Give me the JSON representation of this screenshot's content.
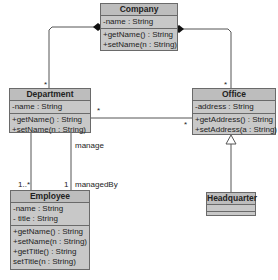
{
  "diagram": {
    "type": "uml-class-diagram",
    "classes": [
      {
        "name": "Company",
        "attributes": [
          "-name : String"
        ],
        "operations": [
          "+getName() : String",
          "+setName(n : String)"
        ]
      },
      {
        "name": "Department",
        "attributes": [
          "-name : String"
        ],
        "operations": [
          "+getName() : String",
          "+setName(n : String)"
        ]
      },
      {
        "name": "Office",
        "attributes": [
          "-address : String"
        ],
        "operations": [
          "+getAddress() : String",
          "+setAddress(a : String)"
        ]
      },
      {
        "name": "Headquarter",
        "attributes": [],
        "operations": []
      },
      {
        "name": "Employee",
        "attributes": [
          "-name : String",
          "- title : String"
        ],
        "operations": [
          "+getName() : String",
          "+setName(n : String)",
          "+getTitle() : String",
          "setTitle(n : String)"
        ]
      }
    ],
    "relationships": [
      {
        "type": "composition",
        "from": "Company",
        "to": "Department",
        "multiplicity_to": "*"
      },
      {
        "type": "composition",
        "from": "Company",
        "to": "Office",
        "multiplicity_to": "*"
      },
      {
        "type": "association",
        "from": "Department",
        "to": "Office",
        "multiplicity_from": "*",
        "multiplicity_to": "*"
      },
      {
        "type": "generalization",
        "from": "Headquarter",
        "to": "Office"
      },
      {
        "type": "association",
        "from": "Department",
        "to": "Employee",
        "label": "manage",
        "multiplicity_to": "1..*"
      },
      {
        "type": "association",
        "from": "Employee",
        "to": "Department",
        "label": "managedBy",
        "multiplicity": "1"
      }
    ],
    "labels": {
      "dept_star": "*",
      "office_star": "*",
      "assoc_dept_star": "*",
      "assoc_office_star": "*",
      "manage": "manage",
      "managedBy": "managedBy",
      "mult_1_many": "1..*",
      "mult_1": "1"
    }
  }
}
